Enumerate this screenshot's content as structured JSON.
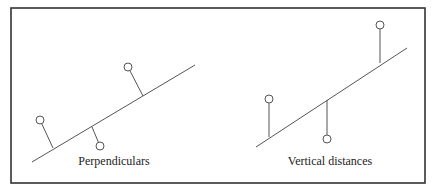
{
  "figure": {
    "frame": {
      "x": 11,
      "y": 8,
      "width": 414,
      "height": 175,
      "stroke": "#333333"
    },
    "colors": {
      "line": "#555555",
      "frame": "#333333",
      "point_fill": "#ffffff",
      "text": "#222222"
    },
    "panels": [
      {
        "id": "perpendiculars",
        "label": "Perpendiculars",
        "label_pos": {
          "x": 114,
          "y": 165
        },
        "fit_line": {
          "x1": 32,
          "y1": 162,
          "x2": 195,
          "y2": 65
        },
        "points": [
          {
            "cx": 40,
            "cy": 120,
            "r": 4,
            "foot_x": 53,
            "foot_y": 148
          },
          {
            "cx": 100,
            "cy": 146,
            "r": 4,
            "foot_x": 92,
            "foot_y": 127
          },
          {
            "cx": 128,
            "cy": 67,
            "r": 4,
            "foot_x": 143,
            "foot_y": 96
          }
        ]
      },
      {
        "id": "vertical-distances",
        "label": "Vertical distances",
        "label_pos": {
          "x": 330,
          "y": 165
        },
        "fit_line": {
          "x1": 256,
          "y1": 147,
          "x2": 407,
          "y2": 48
        },
        "points": [
          {
            "cx": 269,
            "cy": 99,
            "r": 4,
            "foot_x": 269,
            "foot_y": 137
          },
          {
            "cx": 327,
            "cy": 139,
            "r": 4,
            "foot_x": 327,
            "foot_y": 100
          },
          {
            "cx": 380,
            "cy": 25,
            "r": 4,
            "foot_x": 380,
            "foot_y": 63
          }
        ]
      }
    ]
  }
}
